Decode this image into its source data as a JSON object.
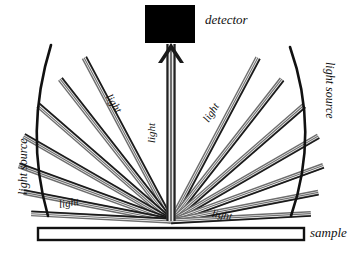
{
  "figure": {
    "type": "optics-schematic",
    "title_text": "",
    "background_color": "#ffffff",
    "ink_color": "#111111",
    "beam_edge_color": "#1a1a1a",
    "beam_fill_color": "#6e6e6e",
    "beam_highlight_color": "#ffffff"
  },
  "detector": {
    "label": "detector",
    "fill_color": "#000000",
    "box": {
      "x": 145,
      "y": 5,
      "width": 50,
      "height": 38
    },
    "label_pos": {
      "x": 205,
      "y": 13
    }
  },
  "sample": {
    "label": "sample",
    "fill_color": "#ffffff",
    "border_color": "#111111",
    "bar": {
      "x": 38,
      "y": 228,
      "width": 266,
      "height": 12
    },
    "label_pos": {
      "x": 310,
      "y": 226
    }
  },
  "sources": [
    {
      "id": "left-source",
      "label": "light source",
      "side": "left",
      "rotation_deg": -90,
      "label_pos": {
        "x": 17,
        "y": 195
      }
    },
    {
      "id": "right-source",
      "label": "light source",
      "side": "right",
      "rotation_deg": 90,
      "label_pos": {
        "x": 336,
        "y": 62
      }
    }
  ],
  "beam_labels": [
    {
      "id": "light-left-upper",
      "text": "light",
      "rotation_deg": 57,
      "pos": {
        "x": 113,
        "y": 92
      }
    },
    {
      "id": "light-center",
      "text": "light",
      "rotation_deg": -90,
      "pos": {
        "x": 146,
        "y": 143
      }
    },
    {
      "id": "light-right-upper",
      "text": "light",
      "rotation_deg": -57,
      "pos": {
        "x": 201,
        "y": 118
      }
    },
    {
      "id": "light-left-lower",
      "text": "light",
      "rotation_deg": -9,
      "pos": {
        "x": 58,
        "y": 199
      }
    },
    {
      "id": "light-right-lower",
      "text": "light",
      "rotation_deg": 9,
      "pos": {
        "x": 213,
        "y": 208
      }
    }
  ],
  "geometry": {
    "convergence_point": {
      "x": 171,
      "y": 221
    },
    "beam_count_per_side": 7,
    "central_beam": {
      "x": 171,
      "top_y": 44,
      "arrow": true
    },
    "left_fan_angles_deg": [
      118,
      128,
      139,
      150,
      160,
      169,
      177
    ],
    "right_fan_angles_deg": [
      62,
      52,
      41,
      30,
      20,
      11,
      3
    ],
    "arc_left": {
      "start": {
        "x": 51,
        "y": 45
      },
      "bulge": {
        "x": 24,
        "y": 132
      },
      "end": {
        "x": 48,
        "y": 216
      }
    },
    "arc_right": {
      "start": {
        "x": 290,
        "y": 47
      },
      "bulge": {
        "x": 320,
        "y": 132
      },
      "end": {
        "x": 291,
        "y": 216
      }
    }
  },
  "footer": {
    "text": "",
    "visible": false
  }
}
